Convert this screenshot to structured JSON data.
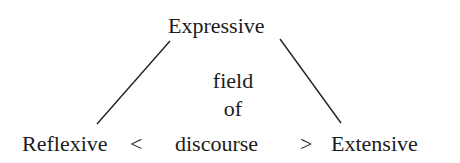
{
  "diagram": {
    "top": "Expressive",
    "left": "Reflexive",
    "right": "Extensive",
    "left_symbol": "<",
    "right_symbol": ">",
    "center_lines": [
      "field",
      "of",
      "discourse"
    ],
    "line_color": "#222222",
    "text_color": "#1c1c1c"
  }
}
